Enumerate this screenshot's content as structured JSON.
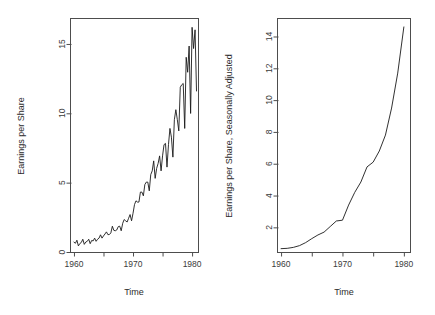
{
  "figure": {
    "background": "#ffffff",
    "line_color": "#1a1a1a",
    "axis_color": "#4d4d4d",
    "panel_count": 2
  },
  "chart_data": [
    {
      "id": "left",
      "type": "line",
      "title": "",
      "xlabel": "Time",
      "ylabel": "Earnings per Share",
      "xlim": [
        1959.5,
        1981.0
      ],
      "ylim": [
        0.0,
        16.8
      ],
      "grid": false,
      "legend": "none",
      "xticks": [
        1960,
        1965,
        1970,
        1975,
        1980
      ],
      "xticklabels": [
        "1960",
        "",
        "1970",
        "",
        "1980"
      ],
      "yticks": [
        0,
        5,
        10,
        15
      ],
      "yticklabels": [
        "0",
        "5",
        "10",
        "15"
      ],
      "series": [
        {
          "name": "Quarterly Earnings per Share",
          "x": [
            1960.0,
            1960.25,
            1960.5,
            1960.75,
            1961.0,
            1961.25,
            1961.5,
            1961.75,
            1962.0,
            1962.25,
            1962.5,
            1962.75,
            1963.0,
            1963.25,
            1963.5,
            1963.75,
            1964.0,
            1964.25,
            1964.5,
            1964.75,
            1965.0,
            1965.25,
            1965.5,
            1965.75,
            1966.0,
            1966.25,
            1966.5,
            1966.75,
            1967.0,
            1967.25,
            1967.5,
            1967.75,
            1968.0,
            1968.25,
            1968.5,
            1968.75,
            1969.0,
            1969.25,
            1969.5,
            1969.75,
            1970.0,
            1970.25,
            1970.5,
            1970.75,
            1971.0,
            1971.25,
            1971.5,
            1971.75,
            1972.0,
            1972.25,
            1972.5,
            1972.75,
            1973.0,
            1973.25,
            1973.5,
            1973.75,
            1974.0,
            1974.25,
            1974.5,
            1974.75,
            1975.0,
            1975.25,
            1975.5,
            1975.75,
            1976.0,
            1976.25,
            1976.5,
            1976.75,
            1977.0,
            1977.25,
            1977.5,
            1977.75,
            1978.0,
            1978.25,
            1978.5,
            1978.75,
            1979.0,
            1979.25,
            1979.5,
            1979.75,
            1980.0,
            1980.25,
            1980.5,
            1980.75
          ],
          "values": [
            0.71,
            0.63,
            0.85,
            0.44,
            0.61,
            0.69,
            0.92,
            0.55,
            0.72,
            0.77,
            0.92,
            0.6,
            0.83,
            0.8,
            1.0,
            0.77,
            0.92,
            1.0,
            1.24,
            1.0,
            1.16,
            1.3,
            1.45,
            1.25,
            1.26,
            1.38,
            1.86,
            1.56,
            1.53,
            1.59,
            1.83,
            1.86,
            1.53,
            2.07,
            2.34,
            2.25,
            2.16,
            2.43,
            2.7,
            2.25,
            2.79,
            3.42,
            3.69,
            3.6,
            3.6,
            4.32,
            4.32,
            4.05,
            4.86,
            5.04,
            5.04,
            4.41,
            5.58,
            5.85,
            6.57,
            5.31,
            6.03,
            6.39,
            6.93,
            5.85,
            6.93,
            7.74,
            7.83,
            6.12,
            7.74,
            8.91,
            8.28,
            6.84,
            9.54,
            10.26,
            9.54,
            8.73,
            11.88,
            12.06,
            12.15,
            8.91,
            14.04,
            12.96,
            14.85,
            9.99,
            16.2,
            14.67,
            16.02,
            11.61
          ]
        }
      ]
    },
    {
      "id": "right",
      "type": "line",
      "title": "",
      "xlabel": "Time",
      "ylabel": "Earnings per Share, Seasonally Adjusted",
      "xlim": [
        1959.5,
        1981.0
      ],
      "ylim": [
        0.45,
        15.1
      ],
      "grid": false,
      "legend": "none",
      "xticks": [
        1960,
        1965,
        1970,
        1975,
        1980
      ],
      "xticklabels": [
        "1960",
        "",
        "1970",
        "",
        "1980"
      ],
      "yticks": [
        2,
        4,
        6,
        8,
        10,
        12,
        14
      ],
      "yticklabels": [
        "2",
        "4",
        "6",
        "8",
        "10",
        "12",
        "14"
      ],
      "series": [
        {
          "name": "Seasonally Adjusted Earnings per Share",
          "x": [
            1960.0,
            1961.0,
            1962.0,
            1963.0,
            1964.0,
            1965.0,
            1966.0,
            1967.0,
            1968.0,
            1969.0,
            1970.0,
            1971.0,
            1972.0,
            1973.0,
            1974.0,
            1975.0,
            1976.0,
            1977.0,
            1978.0,
            1979.0,
            1980.0
          ],
          "values": [
            0.66,
            0.68,
            0.74,
            0.85,
            1.04,
            1.29,
            1.52,
            1.7,
            2.05,
            2.4,
            2.45,
            3.4,
            4.2,
            4.85,
            5.8,
            6.1,
            6.8,
            7.8,
            9.5,
            11.7,
            14.6
          ]
        }
      ]
    }
  ]
}
